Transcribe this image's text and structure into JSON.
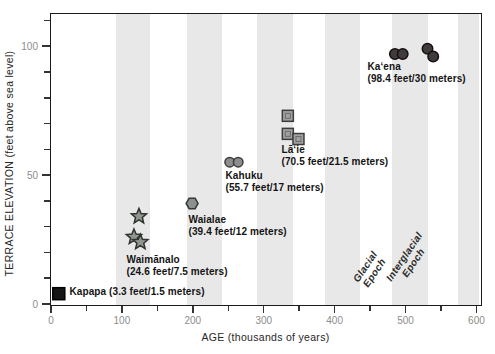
{
  "chart_data": {
    "type": "scatter",
    "title": "",
    "xlabel": "AGE (thousands of years)",
    "ylabel": "TERRACE ELEVATION (feet above sea level)",
    "xlim": [
      0,
      605
    ],
    "ylim": [
      0,
      112.5
    ],
    "x_major_ticks": [
      0,
      100,
      200,
      300,
      400,
      500,
      600
    ],
    "x_minor_ticks": [
      50,
      150,
      250,
      350,
      450,
      550
    ],
    "y_major_ticks": [
      0,
      50,
      100
    ],
    "y_minor_ticks": [
      10,
      20,
      30,
      40,
      60,
      70,
      80,
      90,
      110
    ],
    "grid": false,
    "band_color": "#e8e8e8",
    "frame_color": "#1b1b1b",
    "tick_color": "#333333",
    "tick_label_color": "#8c8c8c",
    "bands": [
      [
        92,
        140
      ],
      [
        192,
        242
      ],
      [
        291,
        342
      ],
      [
        387,
        437
      ],
      [
        482,
        533
      ],
      [
        575,
        605
      ]
    ],
    "series": [
      {
        "id": "kapapa",
        "name": "Kapapa",
        "marker": "square",
        "fill": "#161616",
        "stroke": "#000000",
        "size": 12,
        "points": [
          [
            11,
            4
          ]
        ],
        "elevation_feet": 3.3,
        "elevation_meters": 1.5,
        "label": [
          "Kapapa (3.3 feet/1.5 meters)"
        ],
        "label_pos": [
          19,
          272
        ]
      },
      {
        "id": "waimanalo",
        "name": "Waimānalo",
        "marker": "star",
        "fill": "#90958f",
        "stroke": "#2f342f",
        "size": 16,
        "points": [
          [
            124,
            34
          ],
          [
            117,
            26
          ],
          [
            126,
            24
          ]
        ],
        "elevation_feet": 24.6,
        "elevation_meters": 7.5,
        "label": [
          "Waimānalo",
          "(24.6 feet/7.5 meters)"
        ],
        "label_pos": [
          76,
          240
        ]
      },
      {
        "id": "waialae",
        "name": "Waialae",
        "marker": "hexagon",
        "fill": "#8c918e",
        "stroke": "#343836",
        "size": 12,
        "points": [
          [
            199,
            39
          ]
        ],
        "elevation_feet": 39.4,
        "elevation_meters": 12,
        "label": [
          "Waialae",
          "(39.4 feet/12 meters)"
        ],
        "label_pos": [
          138,
          200
        ]
      },
      {
        "id": "kahuku",
        "name": "Kahuku",
        "marker": "circle",
        "fill": "#8d8d8d",
        "stroke": "#3c3c3c",
        "size": 9.5,
        "points": [
          [
            252,
            55
          ],
          [
            264,
            55
          ]
        ],
        "elevation_feet": 55.7,
        "elevation_meters": 17,
        "label": [
          "Kahuku",
          "(55.7 feet/17 meters)"
        ],
        "label_pos": [
          175,
          156
        ]
      },
      {
        "id": "laie",
        "name": "Lāʻie",
        "marker": "square-grid",
        "fill": "#a1a1a1",
        "stroke": "#3c3c3c",
        "inner": "#6b6b6b",
        "size": 11,
        "points": [
          [
            334,
            73
          ],
          [
            334,
            66
          ],
          [
            349,
            64
          ]
        ],
        "elevation_feet": 70.5,
        "elevation_meters": 21.5,
        "label": [
          "Lāʻie",
          "(70.5 feet/21.5 meters)"
        ],
        "label_pos": [
          231,
          130
        ]
      },
      {
        "id": "kaena",
        "name": "Kaʻena",
        "marker": "circle",
        "fill": "#413b3b",
        "stroke": "#151010",
        "size": 10.5,
        "points": [
          [
            485,
            97
          ],
          [
            496,
            97
          ],
          [
            531,
            99
          ],
          [
            539,
            96
          ]
        ],
        "elevation_feet": 98.4,
        "elevation_meters": 30,
        "label": [
          "Kaʻena",
          "(98.4 feet/30 meters)"
        ],
        "label_pos": [
          317,
          47
        ]
      }
    ],
    "annotations": [
      {
        "id": "glacial",
        "lines": [
          "Glacial",
          "Epoch"
        ],
        "x": 451,
        "y": 13,
        "rotation": -56
      },
      {
        "id": "interglacial",
        "lines": [
          "Interglacial",
          "Epoch"
        ],
        "x": 505,
        "y": 17,
        "rotation": -56
      }
    ]
  }
}
